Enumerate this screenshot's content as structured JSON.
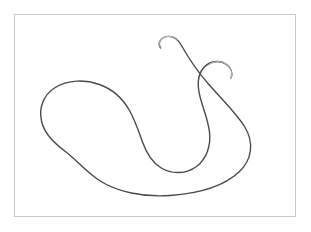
{
  "figure": {
    "title": "",
    "caption": "",
    "background_color": "#ffffff",
    "frame": {
      "border_color": "#c9c9c9",
      "fill_color": "#ffffff",
      "x": 14,
      "y": 14,
      "width": 282,
      "height": 203
    },
    "curve": {
      "label": "open curve with two hooked ends",
      "stroke_color": "#4a4a4a",
      "stroke_color_faded": "#b8b8b8",
      "stroke_width": 1.4,
      "closed": false,
      "endpoints": [
        {
          "name": "upper-left-hook-tip",
          "x": 160,
          "y": 48
        },
        {
          "name": "upper-right-hook-tip",
          "x": 216,
          "y": 76
        }
      ],
      "extents": {
        "left": 41,
        "right": 264,
        "top": 36,
        "bottom": 196
      },
      "outer_path": "M160.5,47.8 C157.0,42.5 161.5,36.6 168.5,36.4 C174.5,36.3 178.8,40.6 181.5,45.5 C188.5,58.0 197.5,71.5 208.0,83.5 C222.0,99.5 236.0,113.0 244.5,126.5 C254.5,142.5 252.0,160.0 239.0,172.0 C224.0,186.0 199.0,193.5 170.0,195.5 C143.0,197.3 117.0,192.0 99.5,180.5 C86.0,171.6 77.0,160.5 66.0,152.0 C54.0,142.8 44.5,134.0 41.6,121.5 C38.5,108.0 43.5,95.0 54.5,88.0 C68.0,79.4 85.5,79.5 99.5,84.5 C113.5,89.5 123.0,99.0 129.5,110.5 C135.0,120.2 138.5,131.0 142.5,142.0 C146.0,151.8 151.0,161.5 160.5,167.5 C172.0,174.8 186.5,174.0 196.5,166.5 C207.0,158.6 211.0,145.0 209.5,132.0 C208.0,119.5 203.0,108.5 200.0,96.5 C197.2,85.5 197.5,75.5 203.0,68.5 C209.0,61.0 219.5,59.5 226.5,64.5 C231.5,68.1 232.8,73.5 231.0,78.0",
      "hook_tip_left_path": "M160.5,47.8 C157.0,42.5 161.5,36.6 168.5,36.4 C172.0,36.3 175.0,37.6 177.3,40.0",
      "hook_tip_right_path": "M231.0,78.0 C232.8,73.5 231.5,68.1 226.5,64.5 C221.5,60.9 214.8,60.6 209.8,64.0"
    }
  }
}
